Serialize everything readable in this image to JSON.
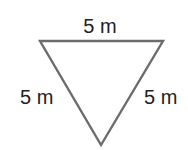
{
  "diagram": {
    "shape": "equilateral-triangle",
    "orientation": "point-down",
    "stroke_color": "#6b6b6b",
    "text_color": "#222222",
    "labels": {
      "top": "5 m",
      "left": "5 m",
      "right": "5 m"
    }
  }
}
